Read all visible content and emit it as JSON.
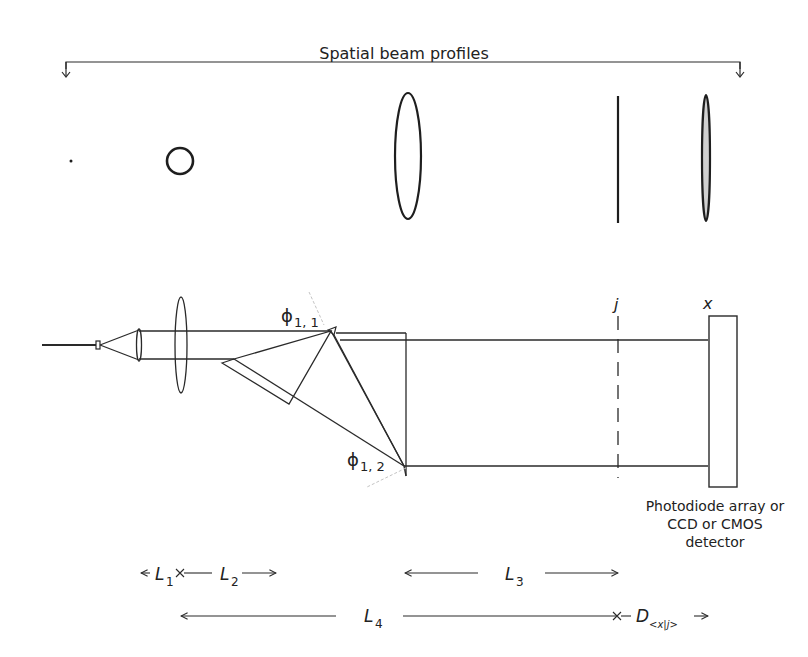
{
  "title": "Spatial beam profiles",
  "colors": {
    "stroke": "#2a2a2a",
    "dash_plane": "#2a2a2a",
    "faint_guides": "#bbbbbb",
    "detector_fill": "#ffffff",
    "profile_fill_last": "#cfcfcf"
  },
  "profiles": [
    {
      "shape": "dot",
      "label": "point"
    },
    {
      "shape": "circle",
      "label": "circle"
    },
    {
      "shape": "tall-ellipse",
      "label": "elongated ellipse"
    },
    {
      "shape": "line",
      "label": "line focus"
    },
    {
      "shape": "thin-ellipse",
      "label": "thin ellipse at detector"
    }
  ],
  "labels": {
    "phi_11": "ϕ",
    "phi_11_sub": "1, 1",
    "phi_12": "ϕ",
    "phi_12_sub": "1, 2",
    "plane_j": "j",
    "plane_x": "x",
    "detector": "Photodiode array or CCD or CMOS detector"
  },
  "dimensions": {
    "L1": {
      "base": "L",
      "sub": "1"
    },
    "L2": {
      "base": "L",
      "sub": "2"
    },
    "L3": {
      "base": "L",
      "sub": "3"
    },
    "L4": {
      "base": "L",
      "sub": "4"
    },
    "D": {
      "base": "D",
      "sub": "<x|j>"
    }
  }
}
